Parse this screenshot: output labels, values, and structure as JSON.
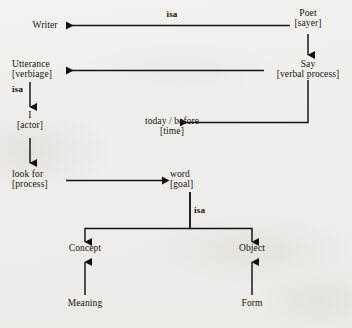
{
  "diagram": {
    "ink_color": "#14110f",
    "background_color": "#f1efec",
    "nodes": [
      {
        "id": "writer",
        "line1": "Writer",
        "line2": ""
      },
      {
        "id": "poet",
        "line1": "Poet",
        "line2": "[sayer]"
      },
      {
        "id": "utterance",
        "line1": "Utterance",
        "line2": "[verbiage]"
      },
      {
        "id": "say",
        "line1": "Say",
        "line2": "[verbal process]"
      },
      {
        "id": "i",
        "line1": "I",
        "line2": "[actor]"
      },
      {
        "id": "todaybefore",
        "line1": "today / before",
        "line2": "[time]"
      },
      {
        "id": "lookfor",
        "line1": "look for",
        "line2": "[process]"
      },
      {
        "id": "word",
        "line1": "word",
        "line2": "[goal]"
      },
      {
        "id": "concept",
        "line1": "Concept",
        "line2": ""
      },
      {
        "id": "object",
        "line1": "Object",
        "line2": ""
      },
      {
        "id": "meaning",
        "line1": "Meaning",
        "line2": ""
      },
      {
        "id": "form",
        "line1": "Form",
        "line2": ""
      }
    ],
    "edge_labels": [
      {
        "id": "isa-top",
        "text": "isa"
      },
      {
        "id": "isa-left",
        "text": "isa"
      },
      {
        "id": "isa-bottom",
        "text": "isa"
      }
    ],
    "edges": [
      {
        "from": "poet",
        "to": "writer",
        "label": "isa"
      },
      {
        "from": "poet",
        "to": "say",
        "label": ""
      },
      {
        "from": "say",
        "to": "utterance",
        "label": ""
      },
      {
        "from": "say",
        "to": "todaybefore",
        "label": ""
      },
      {
        "from": "utterance",
        "to": "i",
        "label": "isa"
      },
      {
        "from": "i",
        "to": "lookfor",
        "label": ""
      },
      {
        "from": "lookfor",
        "to": "word",
        "label": ""
      },
      {
        "from": "word",
        "to": "concept",
        "label": "isa"
      },
      {
        "from": "word",
        "to": "object",
        "label": "isa"
      },
      {
        "from": "meaning",
        "to": "concept",
        "label": ""
      },
      {
        "from": "form",
        "to": "object",
        "label": ""
      }
    ]
  }
}
